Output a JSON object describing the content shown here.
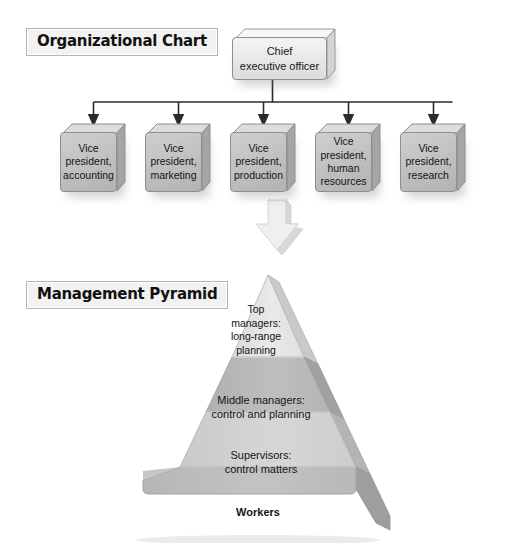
{
  "page": {
    "background": "#ffffff",
    "width": 516,
    "height": 553
  },
  "sections": {
    "org_chart": {
      "title": "Organizational Chart"
    },
    "pyramid": {
      "title": "Management Pyramid"
    }
  },
  "org_chart": {
    "root": {
      "label": "Chief\nexecutive officer",
      "fill": "#e8e8e8"
    },
    "children": [
      {
        "label": "Vice\npresident,\naccounting"
      },
      {
        "label": "Vice\npresident,\nmarketing"
      },
      {
        "label": "Vice\npresident,\nproduction"
      },
      {
        "label": "Vice\npresident,\nhuman\nresources"
      },
      {
        "label": "Vice\npresident,\nresearch"
      }
    ],
    "child_fill": "#c2c2c2",
    "connector_color": "#2b2b2b"
  },
  "flow_arrow": {
    "name": "down-arrow",
    "direction": "down",
    "fill": "#e9e9e9"
  },
  "pyramid": {
    "levels": [
      {
        "name": "top-managers",
        "label": "Top\nmanagers:\nlong-range\nplanning",
        "fill": "#e4e4e4"
      },
      {
        "name": "middle-managers",
        "label": "Middle managers:\ncontrol and planning",
        "fill": "#b9b9b9"
      },
      {
        "name": "supervisors",
        "label": "Supervisors:\ncontrol matters",
        "fill": "#d2d2d2"
      },
      {
        "name": "workers",
        "label": "Workers",
        "fill": "#bcbcbc",
        "bold": true
      }
    ],
    "side_face_fill": "#a8a8a8",
    "outline": "#9a9a9a"
  },
  "colors": {
    "title_plate_bg": "#f2f2f2",
    "title_plate_border": "#b4b4b4",
    "text": "#141414",
    "box_border": "#8e8e8e"
  }
}
